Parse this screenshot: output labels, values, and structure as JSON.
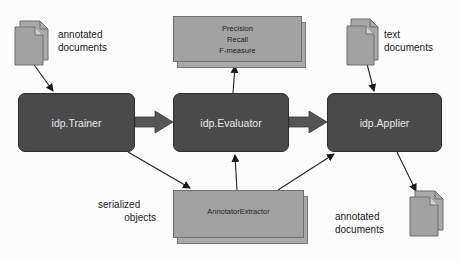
{
  "diagram": {
    "nodes": {
      "trainer": "idp.Trainer",
      "evaluator": "idp.Evaluator",
      "applier": "idp.Applier"
    },
    "metrics_box": {
      "lines": [
        "Precision",
        "Recall",
        "F-measure"
      ]
    },
    "extractor_box": {
      "label": "AnnotatorExtractor"
    },
    "labels": {
      "annotated_documents_in": [
        "annotated",
        "documents"
      ],
      "text_documents": [
        "text",
        "documents"
      ],
      "serialized_objects": [
        "serialized",
        "objects"
      ],
      "annotated_documents_out": [
        "annotated",
        "documents"
      ]
    },
    "colors": {
      "process_box": "#4a4a4a",
      "data_box": "#a2a2a2",
      "arrow": "#222222",
      "thick_arrow": "#555555",
      "background": "#fcfcfc"
    }
  }
}
